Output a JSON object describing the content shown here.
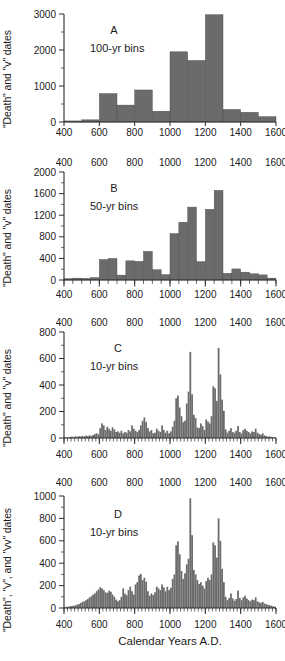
{
  "figure": {
    "xlabel": "Calendar Years A.D.",
    "bar_color": "#6b6b6b",
    "axis_color": "#2b2b2b",
    "background": "#ffffff"
  },
  "chart_data": [
    {
      "type": "bar",
      "panel": "A",
      "label": "A",
      "bins_label": "100-yr bins",
      "title": "",
      "xlabel": "",
      "ylabel": "\"Death\" and \"v\" dates",
      "xlim": [
        400,
        1600
      ],
      "ylim": [
        0,
        3000
      ],
      "yticks": [
        0,
        1000,
        2000,
        3000
      ],
      "xticks": [
        400,
        600,
        800,
        1000,
        1200,
        1400,
        1600
      ],
      "bin_width": 100,
      "grid": false,
      "categories": [
        450,
        550,
        650,
        750,
        850,
        950,
        1050,
        1150,
        1250,
        1350,
        1450,
        1550
      ],
      "values": [
        30,
        60,
        790,
        470,
        890,
        300,
        1950,
        1710,
        2980,
        350,
        270,
        150
      ]
    },
    {
      "type": "bar",
      "panel": "B",
      "label": "B",
      "bins_label": "50-yr bins",
      "title": "",
      "xlabel": "",
      "ylabel": "\"Death\" and \"v\" dates",
      "xlim": [
        400,
        1600
      ],
      "ylim": [
        0,
        2000
      ],
      "yticks": [
        0,
        400,
        800,
        1200,
        1600,
        2000
      ],
      "xticks": [
        400,
        600,
        800,
        1000,
        1200,
        1400,
        1600
      ],
      "bin_width": 50,
      "grid": false,
      "categories": [
        425,
        475,
        525,
        575,
        625,
        675,
        725,
        775,
        825,
        875,
        925,
        975,
        1025,
        1075,
        1125,
        1175,
        1225,
        1275,
        1325,
        1375,
        1425,
        1475,
        1525,
        1575
      ],
      "values": [
        25,
        35,
        30,
        45,
        380,
        400,
        90,
        355,
        345,
        530,
        190,
        100,
        860,
        1070,
        1350,
        340,
        1310,
        1660,
        125,
        205,
        145,
        115,
        95,
        35
      ]
    },
    {
      "type": "bar",
      "panel": "C",
      "label": "C",
      "bins_label": "10-yr bins",
      "title": "",
      "xlabel": "",
      "ylabel": "\"Death\" and \"v\" dates",
      "xlim": [
        400,
        1600
      ],
      "ylim": [
        0,
        800
      ],
      "yticks": [
        0,
        200,
        400,
        600,
        800
      ],
      "xticks": [
        400,
        600,
        800,
        1000,
        1200,
        1400,
        1600
      ],
      "bin_width": 10,
      "grid": false,
      "categories": [
        405,
        415,
        425,
        435,
        445,
        455,
        465,
        475,
        485,
        495,
        505,
        515,
        525,
        535,
        545,
        555,
        565,
        575,
        585,
        595,
        605,
        615,
        625,
        635,
        645,
        655,
        665,
        675,
        685,
        695,
        705,
        715,
        725,
        735,
        745,
        755,
        765,
        775,
        785,
        795,
        805,
        815,
        825,
        835,
        845,
        855,
        865,
        875,
        885,
        895,
        905,
        915,
        925,
        935,
        945,
        955,
        965,
        975,
        985,
        995,
        1005,
        1015,
        1025,
        1035,
        1045,
        1055,
        1065,
        1075,
        1085,
        1095,
        1105,
        1115,
        1125,
        1135,
        1145,
        1155,
        1165,
        1175,
        1185,
        1195,
        1205,
        1215,
        1225,
        1235,
        1245,
        1255,
        1265,
        1275,
        1285,
        1295,
        1305,
        1315,
        1325,
        1335,
        1345,
        1355,
        1365,
        1375,
        1385,
        1395,
        1405,
        1415,
        1425,
        1435,
        1445,
        1455,
        1465,
        1475,
        1485,
        1495,
        1505,
        1515,
        1525,
        1535,
        1545,
        1555,
        1565,
        1575,
        1585,
        1595
      ],
      "values": [
        4,
        6,
        5,
        8,
        10,
        7,
        12,
        9,
        14,
        11,
        16,
        12,
        18,
        14,
        20,
        16,
        22,
        30,
        35,
        28,
        75,
        110,
        95,
        60,
        85,
        70,
        55,
        80,
        65,
        45,
        50,
        40,
        55,
        35,
        45,
        40,
        60,
        50,
        95,
        70,
        55,
        45,
        60,
        95,
        130,
        155,
        120,
        75,
        50,
        60,
        35,
        40,
        70,
        55,
        45,
        95,
        60,
        40,
        55,
        35,
        50,
        85,
        130,
        300,
        320,
        230,
        165,
        120,
        130,
        260,
        350,
        650,
        330,
        175,
        150,
        80,
        75,
        110,
        90,
        60,
        140,
        125,
        110,
        165,
        390,
        375,
        280,
        680,
        480,
        290,
        205,
        65,
        40,
        55,
        75,
        45,
        40,
        55,
        90,
        45,
        35,
        60,
        70,
        55,
        45,
        35,
        50,
        45,
        70,
        40,
        30,
        25,
        35,
        20,
        15,
        10,
        12,
        8,
        6,
        5
      ]
    },
    {
      "type": "bar",
      "panel": "D",
      "label": "D",
      "bins_label": "10-yr bins",
      "title": "",
      "xlabel": "Calendar Years A.D.",
      "ylabel": "\"Death\", \"v\", and \"vv\" dates",
      "xlim": [
        400,
        1600
      ],
      "ylim": [
        0,
        1000
      ],
      "yticks": [
        0,
        200,
        400,
        600,
        800,
        1000
      ],
      "xticks": [
        400,
        600,
        800,
        1000,
        1200,
        1400,
        1600
      ],
      "bin_width": 10,
      "grid": false,
      "categories": [
        405,
        415,
        425,
        435,
        445,
        455,
        465,
        475,
        485,
        495,
        505,
        515,
        525,
        535,
        545,
        555,
        565,
        575,
        585,
        595,
        605,
        615,
        625,
        635,
        645,
        655,
        665,
        675,
        685,
        695,
        705,
        715,
        725,
        735,
        745,
        755,
        765,
        775,
        785,
        795,
        805,
        815,
        825,
        835,
        845,
        855,
        865,
        875,
        885,
        895,
        905,
        915,
        925,
        935,
        945,
        955,
        965,
        975,
        985,
        995,
        1005,
        1015,
        1025,
        1035,
        1045,
        1055,
        1065,
        1075,
        1085,
        1095,
        1105,
        1115,
        1125,
        1135,
        1145,
        1155,
        1165,
        1175,
        1185,
        1195,
        1205,
        1215,
        1225,
        1235,
        1245,
        1255,
        1265,
        1275,
        1285,
        1295,
        1305,
        1315,
        1325,
        1335,
        1345,
        1355,
        1365,
        1375,
        1385,
        1395,
        1405,
        1415,
        1425,
        1435,
        1445,
        1455,
        1465,
        1475,
        1485,
        1495,
        1505,
        1515,
        1525,
        1535,
        1545,
        1555,
        1565,
        1575,
        1585,
        1595
      ],
      "values": [
        8,
        10,
        12,
        15,
        18,
        20,
        25,
        30,
        35,
        45,
        55,
        60,
        70,
        80,
        95,
        105,
        120,
        130,
        150,
        165,
        185,
        175,
        160,
        140,
        135,
        155,
        145,
        120,
        100,
        75,
        60,
        70,
        100,
        175,
        130,
        115,
        160,
        190,
        150,
        120,
        210,
        230,
        290,
        305,
        250,
        270,
        235,
        150,
        110,
        130,
        115,
        140,
        190,
        175,
        160,
        210,
        185,
        150,
        190,
        160,
        180,
        260,
        300,
        560,
        595,
        480,
        330,
        260,
        310,
        390,
        440,
        980,
        650,
        340,
        300,
        250,
        215,
        230,
        200,
        175,
        240,
        270,
        250,
        300,
        585,
        560,
        450,
        800,
        600,
        350,
        230,
        100,
        70,
        90,
        130,
        85,
        65,
        80,
        155,
        90,
        70,
        95,
        110,
        85,
        70,
        60,
        75,
        70,
        95,
        60,
        50,
        45,
        55,
        40,
        35,
        28,
        25,
        20,
        15,
        12
      ]
    }
  ]
}
